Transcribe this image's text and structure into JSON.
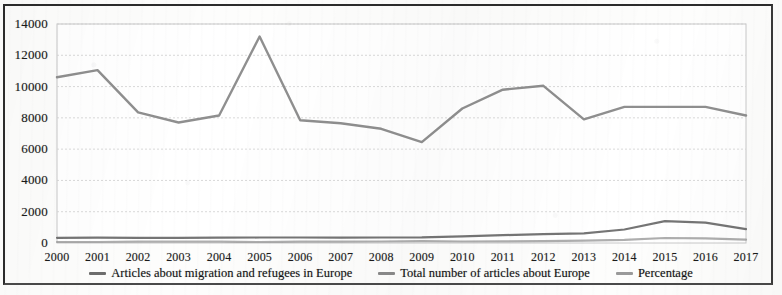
{
  "chart_data": {
    "type": "line",
    "title": "",
    "xlabel": "",
    "ylabel": "",
    "ylim": [
      0,
      14000
    ],
    "ytick_step": 2000,
    "yticks": [
      "0",
      "2000",
      "4000",
      "6000",
      "8000",
      "10000",
      "12000",
      "14000"
    ],
    "grid": true,
    "grid_axis": "y",
    "legend_position": "bottom",
    "categories": [
      "2000",
      "2001",
      "2002",
      "2003",
      "2004",
      "2005",
      "2006",
      "2007",
      "2008",
      "2009",
      "2010",
      "2011",
      "2012",
      "2013",
      "2014",
      "2015",
      "2016",
      "2017"
    ],
    "series": [
      {
        "name": "Articles about migration and refugees in Europe",
        "color": "#6e6e6e",
        "values": [
          330,
          340,
          330,
          330,
          340,
          350,
          350,
          340,
          350,
          360,
          420,
          500,
          560,
          620,
          860,
          1400,
          1300,
          880
        ]
      },
      {
        "name": "Total number of articles about Europe",
        "color": "#8a8a8a",
        "values": [
          10600,
          11050,
          8350,
          7700,
          8150,
          13200,
          7850,
          7650,
          7300,
          6450,
          8600,
          9800,
          10050,
          7900,
          8700,
          8700,
          8700,
          8150
        ]
      },
      {
        "name": "Percentage",
        "color": "#9a9a9a",
        "values": [
          3.1,
          3.1,
          4.0,
          4.3,
          4.2,
          2.7,
          4.5,
          4.4,
          4.8,
          5.6,
          4.9,
          5.1,
          5.6,
          7.8,
          9.9,
          16.1,
          14.9,
          10.8
        ]
      }
    ]
  },
  "legend": {
    "entries": [
      {
        "label": "Articles about migration and refugees in Europe"
      },
      {
        "label": "Total number of articles about Europe"
      },
      {
        "label": "Percentage"
      }
    ]
  }
}
